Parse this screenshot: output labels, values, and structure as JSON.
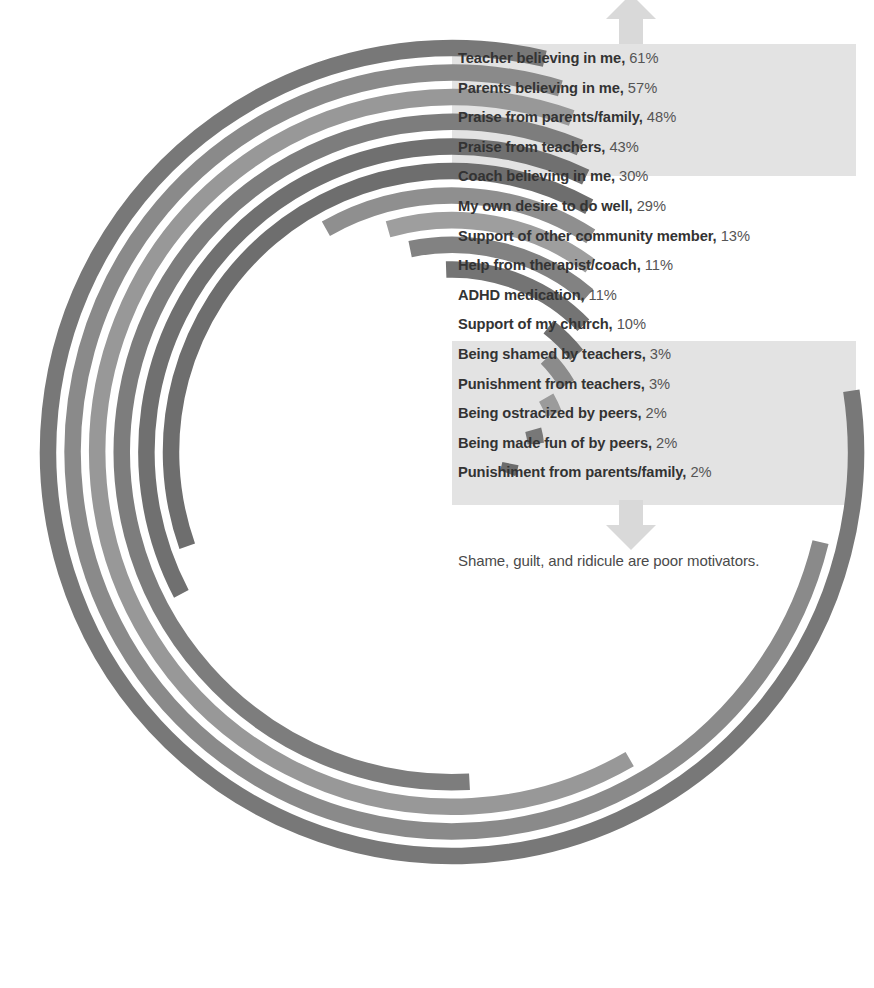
{
  "chart_data": {
    "type": "bar",
    "title": "",
    "subtitle": "",
    "xlabel": "",
    "ylabel": "",
    "orientation": "radial",
    "grid": false,
    "legend_position": "inline-right",
    "value_suffix": "%",
    "xlim": [
      0,
      61
    ],
    "categories": [
      "Teacher believing in me",
      "Parents believing in me",
      "Praise from parents/family",
      "Praise from teachers",
      "Coach believing in me",
      "My own desire to do well",
      "Support of other community member",
      "Help from therapist/coach",
      "ADHD medication",
      "Support of my church",
      "Being shamed by teachers",
      "Punishment from teachers",
      "Being ostracized by peers",
      "Being made fun of by peers",
      "Punishiment from parents/family"
    ],
    "values": [
      61,
      57,
      48,
      43,
      30,
      29,
      13,
      11,
      11,
      10,
      3,
      3,
      2,
      2,
      2
    ],
    "value_labels": [
      "61%",
      "57%",
      "48%",
      "43%",
      "30%",
      "29%",
      "13%",
      "11%",
      "11%",
      "10%",
      "3%",
      "3%",
      "2%",
      "2%",
      "2%"
    ],
    "series": [
      {
        "name": "Percent of respondents",
        "values": [
          61,
          57,
          48,
          43,
          30,
          29,
          13,
          11,
          11,
          10,
          3,
          3,
          2,
          2,
          2
        ]
      }
    ],
    "annotations": [
      "Shame, guilt, and ridicule are poor motivators."
    ]
  },
  "rows": [
    {
      "name": "Teacher believing in me,",
      "pct": "61%",
      "value": 61,
      "color": "#787878"
    },
    {
      "name": "Parents believing in me,",
      "pct": "57%",
      "value": 57,
      "color": "#8a8a8a"
    },
    {
      "name": "Praise from parents/family,",
      "pct": "48%",
      "value": 48,
      "color": "#989898"
    },
    {
      "name": "Praise from teachers,",
      "pct": "43%",
      "value": 43,
      "color": "#7d7d7d"
    },
    {
      "name": "Coach believing in me,",
      "pct": "30%",
      "value": 30,
      "color": "#707070"
    },
    {
      "name": "My own desire to do well,",
      "pct": "29%",
      "value": 29,
      "color": "#6e6e6e"
    },
    {
      "name": "Support of other community member,",
      "pct": "13%",
      "value": 13,
      "color": "#8f8f8f"
    },
    {
      "name": "Help from therapist/coach,",
      "pct": "11%",
      "value": 11,
      "color": "#9e9e9e"
    },
    {
      "name": "ADHD medication,",
      "pct": "11%",
      "value": 11,
      "color": "#828282"
    },
    {
      "name": "Support of my church,",
      "pct": "10%",
      "value": 10,
      "color": "#747474"
    },
    {
      "name": "Being shamed by teachers,",
      "pct": "3%",
      "value": 3,
      "color": "#707070"
    },
    {
      "name": "Punishment from teachers,",
      "pct": "3%",
      "value": 3,
      "color": "#8b8b8b"
    },
    {
      "name": "Being ostracized by peers,",
      "pct": "2%",
      "value": 2,
      "color": "#9b9b9b"
    },
    {
      "name": "Being made fun of by peers,",
      "pct": "2%",
      "value": 2,
      "color": "#787878"
    },
    {
      "name": "Punishiment from parents/family,",
      "pct": "2%",
      "value": 2,
      "color": "#6c6c6c"
    }
  ],
  "caption": "Shame, guilt, and ridicule are poor motivators.",
  "arrows": {
    "up": "arrow-up-icon",
    "down": "arrow-down-icon",
    "color": "#d9d9d9"
  },
  "highlight": {
    "color": "#e3e3e3",
    "top_group_first": 0,
    "top_group_last": 3,
    "bottom_group_first": 10,
    "bottom_group_last": 14
  }
}
